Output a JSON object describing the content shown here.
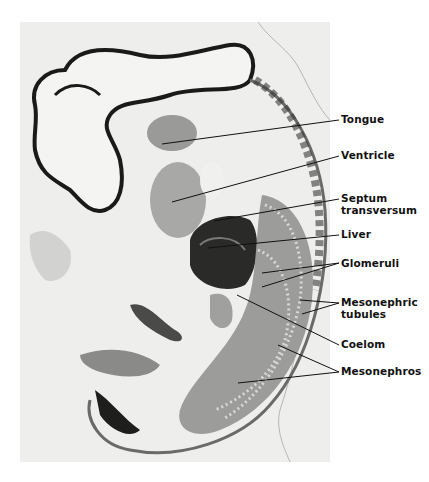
{
  "figure": {
    "labels": [
      {
        "id": "tongue",
        "text": "Tongue",
        "x": 341,
        "y": 114
      },
      {
        "id": "ventricle",
        "text": "Ventricle",
        "x": 341,
        "y": 150
      },
      {
        "id": "septum-transversum",
        "text": "Septum",
        "text2": "transversum",
        "x": 341,
        "y": 193
      },
      {
        "id": "liver",
        "text": "Liver",
        "x": 341,
        "y": 229
      },
      {
        "id": "glomeruli",
        "text": "Glomeruli",
        "x": 341,
        "y": 258
      },
      {
        "id": "mesonephric-tubules",
        "text": "Mesonephric",
        "text2": "tubules",
        "x": 341,
        "y": 297
      },
      {
        "id": "coelom",
        "text": "Coelom",
        "x": 341,
        "y": 339
      },
      {
        "id": "mesonephros",
        "text": "Mesonephros",
        "x": 341,
        "y": 366
      }
    ],
    "colors": {
      "background": "#ffffff",
      "photo_bg": "#eeeeec",
      "tissue_dark": "#1a1a1a",
      "tissue_mid": "#8a8a88",
      "tissue_light": "#c8c8c6",
      "label": "#111111"
    }
  }
}
